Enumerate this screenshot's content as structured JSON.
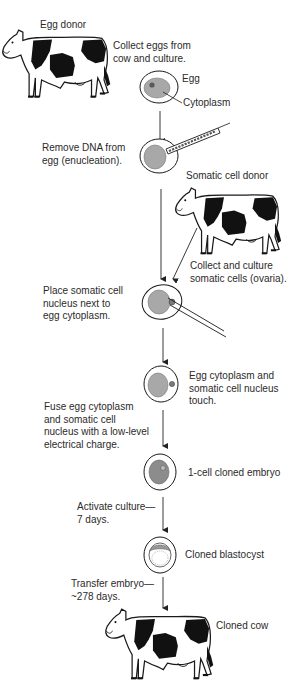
{
  "diagram": {
    "labels": {
      "egg_donor": "Egg donor",
      "collect_eggs": [
        "Collect eggs from",
        "cow and culture."
      ],
      "egg": "Egg",
      "cytoplasm": "Cytoplasm",
      "remove_dna": [
        "Remove DNA from",
        "egg (enucleation)."
      ],
      "somatic_donor": "Somatic cell donor",
      "collect_somatic": [
        "Collect and culture",
        "somatic cells (ovaria)."
      ],
      "place_nucleus": [
        "Place somatic cell",
        "nucleus next to",
        "egg cytoplasm."
      ],
      "touch": [
        "Egg cytoplasm and",
        "somatic cell nucleus",
        "touch."
      ],
      "fuse": [
        "Fuse egg cytoplasm",
        "and somatic cell",
        "nucleus with a low-level",
        "electrical charge."
      ],
      "one_cell": "1-cell cloned embryo",
      "activate": [
        "Activate culture—",
        "7 days."
      ],
      "blastocyst": "Cloned blastocyst",
      "transfer": [
        "Transfer embryo—",
        "~278 days."
      ],
      "cloned_cow": "Cloned cow"
    },
    "colors": {
      "ink": "#1a1a1a",
      "cytoplasm": "#a8a8a8",
      "nucleus": "#5a5a5a",
      "background": "#ffffff"
    },
    "nodes": [
      {
        "id": "egg-donor-cow",
        "type": "cow"
      },
      {
        "id": "egg-cell",
        "type": "cell"
      },
      {
        "id": "enucleated-egg",
        "type": "cell"
      },
      {
        "id": "somatic-donor-cow",
        "type": "cow"
      },
      {
        "id": "nucleus-placement",
        "type": "cell"
      },
      {
        "id": "touching-cell",
        "type": "cell"
      },
      {
        "id": "one-cell-embryo",
        "type": "cell"
      },
      {
        "id": "blastocyst",
        "type": "cell"
      },
      {
        "id": "cloned-cow",
        "type": "cow"
      }
    ]
  }
}
